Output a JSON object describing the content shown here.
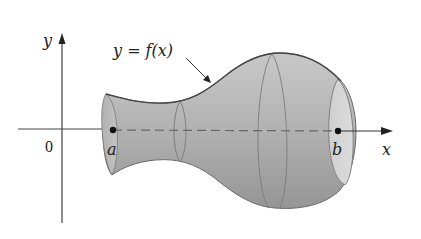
{
  "figure": {
    "labels": {
      "y_axis": "y",
      "x_axis": "x",
      "origin": "0",
      "point_a": "a",
      "point_b": "b",
      "curve": "y = f(x)"
    },
    "colors": {
      "solid_fill": "#a9a9a9",
      "solid_light": "#d0d0d0",
      "outline": "#555555",
      "axis": "#333333"
    }
  }
}
